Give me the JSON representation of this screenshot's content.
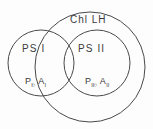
{
  "figure": {
    "background_color": "#fdfdfd",
    "stroke_color": "#4a4a4a",
    "text_color": "#3b3b3b"
  },
  "shapes": {
    "outer_circle": {
      "name": "chlorophyll-light-harvesting-boundary",
      "label": "Chl LH",
      "cx": 90,
      "cy": 67,
      "r": 55
    },
    "ps1_circle": {
      "name": "photosystem-one-boundary",
      "label": "PS I",
      "cx": 41,
      "cy": 63,
      "r": 33
    },
    "ps2_circle": {
      "name": "photosystem-two-boundary",
      "label": "PS II",
      "cx": 97,
      "cy": 63,
      "r": 33
    }
  },
  "labels": {
    "chl_lh": "Chl LH",
    "ps1": "PS I",
    "ps2": "PS II",
    "reaction_center_1": {
      "p_symbol": "P",
      "p_subscript": "I",
      "p_degree": "○",
      "a_symbol": "A",
      "a_subscript": "I",
      "full_text": "P₁°A₁"
    },
    "reaction_center_2": {
      "p_symbol": "P",
      "p_subscript": "II",
      "p_degree": "○",
      "a_symbol": "A",
      "a_subscript": "II",
      "full_text": "P₂°A₂"
    }
  }
}
